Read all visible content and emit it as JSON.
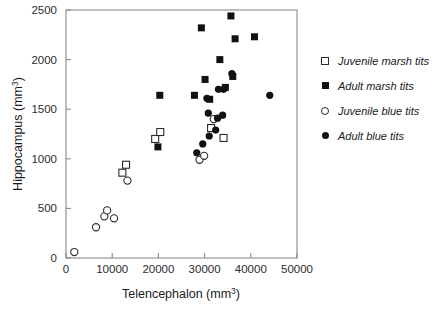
{
  "chart_data": {
    "type": "scatter",
    "title": "",
    "xlabel": "Telencephalon (mm3)",
    "xlabel_base": "Telencephalon (mm",
    "xlabel_sup": "3",
    "xlabel_tail": ")",
    "ylabel": "Hippocampus (mm3)",
    "ylabel_base": "Hippocampus (mm",
    "ylabel_sup": "3",
    "ylabel_tail": ")",
    "xlim": [
      0,
      50000
    ],
    "ylim": [
      0,
      2500
    ],
    "xticks": [
      0,
      10000,
      20000,
      30000,
      40000,
      50000
    ],
    "xtick_labels": [
      "0",
      "10000",
      "20000",
      "30000",
      "40000",
      "50000"
    ],
    "yticks": [
      0,
      500,
      1000,
      1500,
      2000,
      2500
    ],
    "ytick_labels": [
      "0",
      "500",
      "1000",
      "1500",
      "2000",
      "2500"
    ],
    "grid": false,
    "legend_position": "right",
    "frame": "box",
    "series": [
      {
        "name": "Juvenile marsh tits",
        "marker": "open-square",
        "color": "#2b2b2b",
        "points": [
          [
            12200,
            860
          ],
          [
            13000,
            940
          ],
          [
            19300,
            1200
          ],
          [
            20400,
            1270
          ],
          [
            31400,
            1310
          ],
          [
            34100,
            1210
          ]
        ]
      },
      {
        "name": "Adult marsh tits",
        "marker": "filled-square",
        "color": "#111111",
        "points": [
          [
            19900,
            1120
          ],
          [
            20300,
            1640
          ],
          [
            27800,
            1640
          ],
          [
            29300,
            2320
          ],
          [
            30100,
            1800
          ],
          [
            31100,
            1600
          ],
          [
            33300,
            2000
          ],
          [
            34500,
            1720
          ],
          [
            35700,
            2440
          ],
          [
            36100,
            1830
          ],
          [
            36600,
            2210
          ],
          [
            40800,
            2230
          ]
        ]
      },
      {
        "name": "Juvenile blue tits",
        "marker": "open-circle",
        "color": "#2b2b2b",
        "points": [
          [
            1800,
            60
          ],
          [
            6500,
            310
          ],
          [
            8300,
            420
          ],
          [
            8900,
            480
          ],
          [
            10400,
            400
          ],
          [
            13300,
            780
          ],
          [
            28900,
            990
          ],
          [
            29900,
            1030
          ],
          [
            32000,
            1400
          ]
        ]
      },
      {
        "name": "Adult blue tits",
        "marker": "filled-circle",
        "color": "#111111",
        "points": [
          [
            28300,
            1060
          ],
          [
            29600,
            1150
          ],
          [
            30500,
            1610
          ],
          [
            30800,
            1460
          ],
          [
            31000,
            1230
          ],
          [
            32400,
            1290
          ],
          [
            32800,
            1410
          ],
          [
            33000,
            1700
          ],
          [
            33900,
            1440
          ],
          [
            34100,
            1700
          ],
          [
            35900,
            1860
          ],
          [
            44100,
            1640
          ]
        ]
      }
    ]
  },
  "legend": {
    "entries": [
      {
        "label": "Juvenile marsh tits",
        "marker": "open-square"
      },
      {
        "label": "Adult marsh tits",
        "marker": "filled-square"
      },
      {
        "label": "Juvenile blue tits",
        "marker": "open-circle"
      },
      {
        "label": "Adult blue tits",
        "marker": "filled-circle"
      }
    ]
  }
}
